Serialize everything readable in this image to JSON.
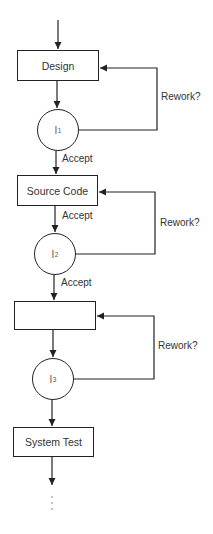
{
  "diagram": {
    "type": "inspection-flowchart",
    "stages": [
      {
        "id": "design",
        "label": "Design"
      },
      {
        "id": "source_code",
        "label": "Source Code"
      },
      {
        "id": "unnamed_stage",
        "label": ""
      },
      {
        "id": "system_test",
        "label": "System Test"
      }
    ],
    "inspections": [
      {
        "id": "I1",
        "label": "I",
        "subscript": "1"
      },
      {
        "id": "I2",
        "label": "I",
        "subscript": "2"
      },
      {
        "id": "I3",
        "label": "I",
        "subscript": "3"
      }
    ],
    "edge_labels": {
      "accept_1": "Accept",
      "accept_2a": "Accept",
      "accept_2b": "Accept",
      "rework_1": "Rework?",
      "rework_2": "Rework?",
      "rework_3": "Rework?"
    },
    "continuation": "⋮",
    "colors": {
      "line": "#222222",
      "text": "#333333",
      "background": "#ffffff"
    }
  }
}
